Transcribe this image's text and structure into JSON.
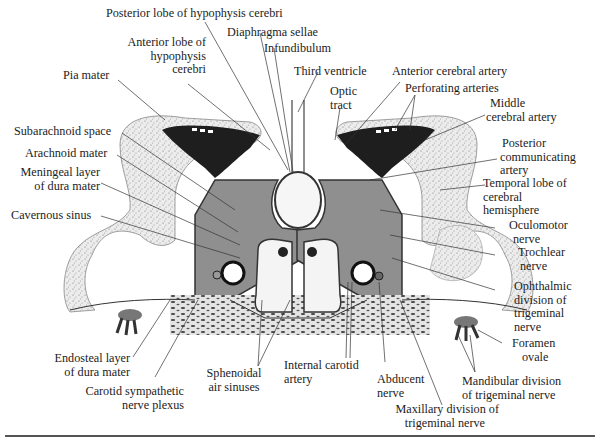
{
  "figure": {
    "colors": {
      "background": "#ffffff",
      "ink": "#1c1c1c",
      "cortex_stipple": "#d9d9d9",
      "sinus_fill": "#8a8a8a",
      "artery_dark": "#1e1e1e",
      "bone_stipple": "#6e6e6e"
    }
  },
  "labels": {
    "posterior_lobe": "Posterior lobe of hypophysis cerebri",
    "diaphragma_sellae": "Diaphragma sellae",
    "infundibulum": "Infundibulum",
    "third_ventricle": "Third ventricle",
    "anterior_lobe_1": "Anterior lobe of",
    "anterior_lobe_2": "hypophysis",
    "anterior_lobe_3": "cerebri",
    "pia_mater": "Pia mater",
    "optic_tract_1": "Optic",
    "optic_tract_2": "tract",
    "anterior_cerebral_artery": "Anterior cerebral artery",
    "perforating_arteries": "Perforating arteries",
    "middle_cerebral_1": "Middle",
    "middle_cerebral_2": "cerebral artery",
    "subarachnoid_space": "Subarachnoid space",
    "arachnoid_mater": "Arachnoid mater",
    "meningeal_layer_1": "Meningeal layer",
    "meningeal_layer_2": "of dura mater",
    "posterior_communicating_1": "Posterior",
    "posterior_communicating_2": "communicating",
    "posterior_communicating_3": "artery",
    "temporal_lobe_1": "Temporal lobe of",
    "temporal_lobe_2": "cerebral",
    "temporal_lobe_3": "hemisphere",
    "cavernous_sinus": "Cavernous sinus",
    "oculomotor_1": "Oculomotor",
    "oculomotor_2": "nerve",
    "trochlear_1": "Trochlear",
    "trochlear_2": "nerve",
    "ophthalmic_1": "Ophthalmic",
    "ophthalmic_2": "division of",
    "ophthalmic_3": "trigeminal",
    "ophthalmic_4": "nerve",
    "foramen_ovale_1": "Foramen",
    "foramen_ovale_2": "ovale",
    "endosteal_1": "Endosteal layer",
    "endosteal_2": "of dura mater",
    "carotid_plexus_1": "Carotid sympathetic",
    "carotid_plexus_2": "nerve plexus",
    "sphenoidal_1": "Sphenoidal",
    "sphenoidal_2": "air sinuses",
    "internal_carotid_1": "Internal carotid",
    "internal_carotid_2": "artery",
    "abducent_1": "Abducent",
    "abducent_2": "nerve",
    "mandibular_1": "Mandibular division",
    "mandibular_2": "of trigeminal nerve",
    "maxillary_1": "Maxillary division of",
    "maxillary_2": "trigeminal nerve"
  }
}
